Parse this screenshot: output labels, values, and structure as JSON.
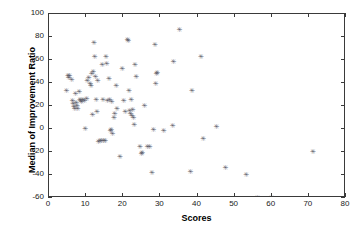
{
  "chart_data": {
    "type": "scatter",
    "title": "",
    "xlabel": "Scores",
    "ylabel": "Median of Improvement Ratio",
    "xlim": [
      0,
      80
    ],
    "ylim": [
      -60,
      100
    ],
    "xticks": [
      0,
      10,
      20,
      30,
      40,
      50,
      60,
      70,
      80
    ],
    "yticks": [
      -60,
      -40,
      -20,
      0,
      20,
      40,
      60,
      80,
      100
    ],
    "grid": false,
    "legend": null,
    "marker": "asterisk",
    "marker_color": "#5a5a66",
    "series": [
      {
        "name": "observations",
        "points": [
          [
            4.6,
            33
          ],
          [
            5.0,
            46
          ],
          [
            5.2,
            44
          ],
          [
            5.4,
            46
          ],
          [
            6.0,
            42
          ],
          [
            6.2,
            24
          ],
          [
            6.4,
            21
          ],
          [
            6.6,
            19
          ],
          [
            6.8,
            17
          ],
          [
            7.0,
            30
          ],
          [
            7.2,
            22
          ],
          [
            7.4,
            20
          ],
          [
            7.6,
            17
          ],
          [
            8.0,
            32
          ],
          [
            8.2,
            25
          ],
          [
            8.4,
            24
          ],
          [
            8.6,
            23
          ],
          [
            9.0,
            25
          ],
          [
            9.4,
            24
          ],
          [
            9.6,
            0
          ],
          [
            10.0,
            26
          ],
          [
            10.2,
            41
          ],
          [
            10.6,
            44
          ],
          [
            11.0,
            39
          ],
          [
            11.2,
            37
          ],
          [
            11.4,
            47
          ],
          [
            11.6,
            12
          ],
          [
            11.8,
            49
          ],
          [
            12.0,
            74
          ],
          [
            12.2,
            62
          ],
          [
            12.4,
            45
          ],
          [
            12.6,
            25
          ],
          [
            12.8,
            14
          ],
          [
            13.0,
            41
          ],
          [
            13.2,
            -12
          ],
          [
            13.6,
            -11
          ],
          [
            14.0,
            -11
          ],
          [
            14.2,
            55
          ],
          [
            14.4,
            25
          ],
          [
            14.6,
            -11
          ],
          [
            15.0,
            -11
          ],
          [
            15.2,
            62
          ],
          [
            15.4,
            56
          ],
          [
            15.6,
            24
          ],
          [
            16.0,
            43
          ],
          [
            16.2,
            25
          ],
          [
            16.4,
            -2
          ],
          [
            16.6,
            -1
          ],
          [
            16.8,
            23
          ],
          [
            17.0,
            -5
          ],
          [
            17.4,
            9
          ],
          [
            17.6,
            13
          ],
          [
            18.0,
            37
          ],
          [
            18.2,
            17
          ],
          [
            19.0,
            -25
          ],
          [
            19.6,
            52
          ],
          [
            20.0,
            24
          ],
          [
            20.4,
            14
          ],
          [
            21.0,
            77
          ],
          [
            21.2,
            76
          ],
          [
            21.4,
            33
          ],
          [
            21.6,
            15
          ],
          [
            21.8,
            13
          ],
          [
            22.0,
            25
          ],
          [
            22.2,
            11
          ],
          [
            22.4,
            16
          ],
          [
            22.6,
            9
          ],
          [
            22.8,
            3
          ],
          [
            23.0,
            55
          ],
          [
            23.4,
            45
          ],
          [
            24.4,
            -16
          ],
          [
            24.8,
            -22
          ],
          [
            25.0,
            -21
          ],
          [
            25.6,
            20
          ],
          [
            26.4,
            -16
          ],
          [
            27.0,
            -16
          ],
          [
            27.6,
            -39
          ],
          [
            28.0,
            -1
          ],
          [
            28.4,
            73
          ],
          [
            28.6,
            39
          ],
          [
            28.8,
            47
          ],
          [
            29.0,
            48
          ],
          [
            30.8,
            -2
          ],
          [
            33.2,
            2
          ],
          [
            33.4,
            58
          ],
          [
            35.0,
            86
          ],
          [
            38.0,
            -38
          ],
          [
            38.4,
            33
          ],
          [
            40.8,
            62
          ],
          [
            41.4,
            -9
          ],
          [
            45.0,
            1
          ],
          [
            47.4,
            -34
          ],
          [
            53.0,
            -40
          ],
          [
            56.0,
            -60
          ],
          [
            59.8,
            -60
          ],
          [
            71.0,
            -20
          ]
        ]
      }
    ]
  }
}
